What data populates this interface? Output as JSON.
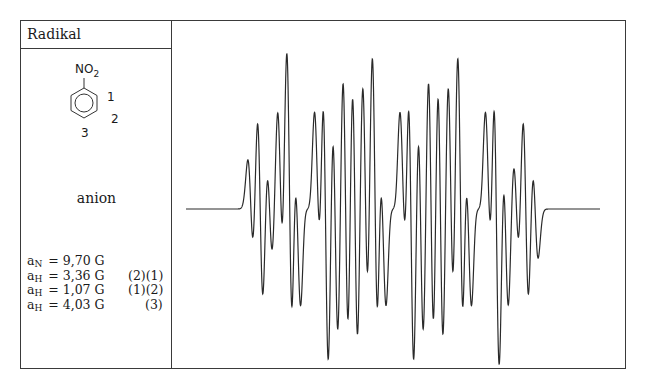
{
  "table": {
    "header": "Radikal",
    "structure": {
      "substituent": "NO",
      "substituent_sub": "2",
      "ring": "benzene",
      "position_labels": [
        "1",
        "2",
        "3"
      ]
    },
    "radical_type": "anion",
    "coupling_constants": [
      {
        "symbol": "a",
        "nucleus": "N",
        "value": "= 9,70 G",
        "positions": ""
      },
      {
        "symbol": "a",
        "nucleus": "H",
        "value": "= 3,36 G",
        "positions": "(2)(1)"
      },
      {
        "symbol": "a",
        "nucleus": "H",
        "value": "= 1,07 G",
        "positions": "(1)(2)"
      },
      {
        "symbol": "a",
        "nucleus": "H",
        "value": "= 4,03 G",
        "positions": "(3)"
      }
    ]
  },
  "chart_data": {
    "type": "line",
    "xlabel": "",
    "ylabel": "",
    "grid": false,
    "hyperfine": [
      {
        "nucleus": "N",
        "count": 1,
        "spin": 1,
        "a_G": 9.7
      },
      {
        "nucleus": "H",
        "count": 2,
        "spin": 0.5,
        "a_G": 3.36
      },
      {
        "nucleus": "H",
        "count": 2,
        "spin": 0.5,
        "a_G": 1.07
      },
      {
        "nucleus": "H",
        "count": 1,
        "spin": 0.5,
        "a_G": 4.03
      }
    ],
    "linewidth_G": 0.33,
    "field_range_G": [
      -17.5,
      17.5
    ],
    "baseline_span_G": [
      -23.5,
      23.5
    ],
    "line_color": "#2a2a2a"
  }
}
